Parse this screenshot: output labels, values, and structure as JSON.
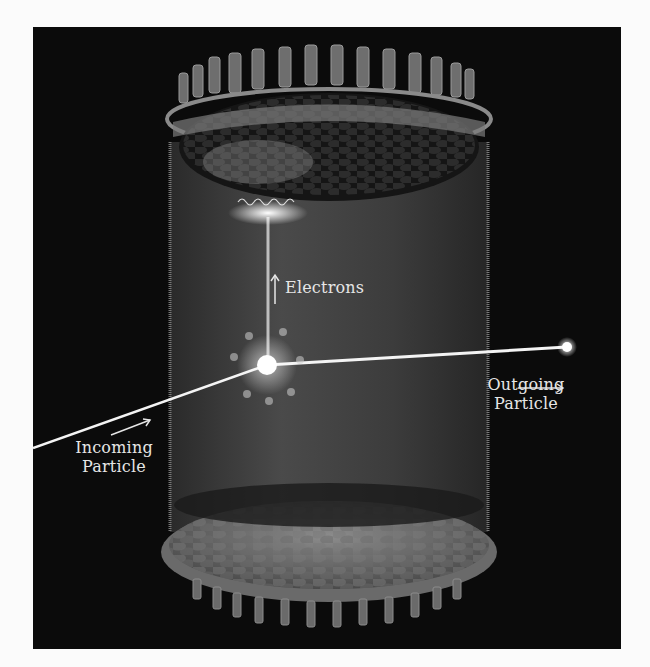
{
  "figure": {
    "background_color": "#0b0b0b",
    "page_color": "#fbfbfb",
    "labels": {
      "electrons": "Electrons",
      "outgoing_line1": "Outgoing",
      "outgoing_line2": "Particle",
      "incoming_line1": "Incoming",
      "incoming_line2": "Particle"
    },
    "arrows": {
      "electrons": "arrow-up",
      "outgoing": "arrow-right",
      "incoming": "arrow-up-right"
    },
    "components": [
      "top-photomultiplier-array",
      "bottom-photomultiplier-array",
      "cylindrical-field-cage",
      "interaction-flash",
      "electron-drift-track",
      "incoming-particle-track",
      "outgoing-particle-track",
      "scintillation-flash"
    ],
    "colors": {
      "glow": "#ffffff",
      "cylinder": "#3a3a3a",
      "metal": "#8a8a8a",
      "text": "#e6e6e6"
    }
  }
}
